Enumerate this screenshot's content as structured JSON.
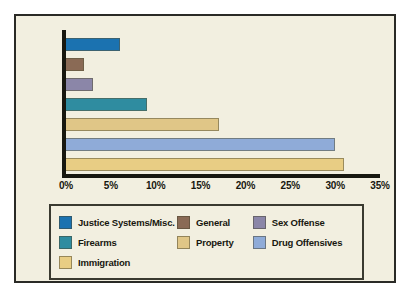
{
  "chart_data": {
    "type": "bar",
    "orientation": "horizontal",
    "title": "",
    "xlabel": "",
    "ylabel": "",
    "xlim": [
      0,
      35
    ],
    "grid": false,
    "legend_position": "bottom",
    "categories": [
      "Justice Systems/Misc.",
      "General",
      "Sex Offense",
      "Firearms",
      "Property",
      "Drug Offensives",
      "Immigration"
    ],
    "values": [
      6,
      2,
      3,
      9,
      17,
      30,
      31
    ],
    "value_suffix": "%",
    "colors": [
      "#1b72b0",
      "#8a6a55",
      "#8b86a8",
      "#2f8ca0",
      "#e0c687",
      "#8fabd8",
      "#e8cd84"
    ],
    "ticks": [
      {
        "label": "0%",
        "value": 0
      },
      {
        "label": "5%",
        "value": 5
      },
      {
        "label": "10%",
        "value": 10
      },
      {
        "label": "15%",
        "value": 15
      },
      {
        "label": "20%",
        "value": 20
      },
      {
        "label": "25%",
        "value": 25
      },
      {
        "label": "30%",
        "value": 30
      },
      {
        "label": "35%",
        "value": 35
      }
    ],
    "legend": [
      {
        "label": "Justice Systems/Misc.",
        "color": "#1b72b0"
      },
      {
        "label": "General",
        "color": "#8a6a55"
      },
      {
        "label": "Sex Offense",
        "color": "#8b86a8"
      },
      {
        "label": "Firearms",
        "color": "#2f8ca0"
      },
      {
        "label": "Property",
        "color": "#e0c687"
      },
      {
        "label": "Drug Offensives",
        "color": "#8fabd8"
      },
      {
        "label": "Immigration",
        "color": "#e8cd84"
      }
    ]
  },
  "style": {
    "background": "#f2efe0",
    "frame_color": "#2a2a26",
    "axis_color": "#17170f",
    "page_background": "#ffffff"
  }
}
